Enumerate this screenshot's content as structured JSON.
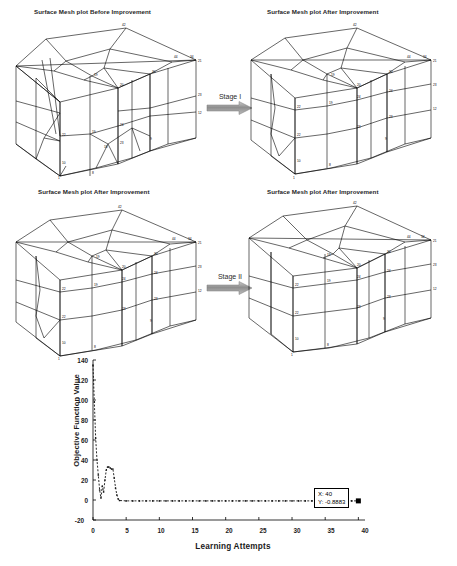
{
  "figure": {
    "panels": [
      {
        "id": "before",
        "title": "Surface Mesh plot Before Improvement"
      },
      {
        "id": "after-stage1",
        "title": "Surface Mesh plot After Improvement"
      },
      {
        "id": "after-stage1-repeat",
        "title": "Surface Mesh plot After Improvement"
      },
      {
        "id": "after-stage2",
        "title": "Surface Mesh plot After Improvement"
      }
    ],
    "arrows": [
      {
        "id": "stage-1",
        "label": "Stage I"
      },
      {
        "id": "stage-2",
        "label": "Stage II"
      }
    ]
  },
  "mesh_node_labels": {
    "before": [
      "42",
      "44",
      "34",
      "21",
      "20",
      "30",
      "19",
      "24",
      "23",
      "12",
      "18",
      "23",
      "22",
      "10",
      "9",
      "8",
      "1"
    ],
    "after": [
      "42",
      "44",
      "34",
      "21",
      "20",
      "30",
      "19",
      "24",
      "23",
      "12",
      "22",
      "10",
      "9",
      "8",
      "1"
    ]
  },
  "chart_data": {
    "type": "line",
    "title": "",
    "xlabel": "Learning Attempts",
    "ylabel": "Objective Function Value",
    "xlim": [
      0,
      41
    ],
    "ylim": [
      -20,
      140
    ],
    "xticks": [
      0,
      5,
      10,
      15,
      20,
      25,
      30,
      35,
      40
    ],
    "yticks": [
      -20,
      0,
      20,
      40,
      60,
      80,
      100,
      120,
      140
    ],
    "grid": false,
    "legend": null,
    "line_style": "dashed",
    "marker": "dot",
    "series": [
      {
        "name": "Objective Function Value",
        "x": [
          0,
          0.2,
          0.4,
          0.6,
          0.8,
          1.0,
          1.2,
          1.4,
          1.6,
          1.8,
          2.0,
          2.2,
          2.4,
          2.6,
          2.8,
          3.0,
          3.2,
          3.4,
          3.6,
          3.8,
          4.0,
          5,
          6,
          7,
          8,
          9,
          10,
          11,
          12,
          13,
          14,
          15,
          16,
          17,
          18,
          19,
          20,
          21,
          22,
          23,
          24,
          25,
          26,
          27,
          28,
          29,
          30,
          31,
          32,
          33,
          34,
          35,
          36,
          37,
          38,
          39,
          40
        ],
        "values": [
          135,
          98,
          62,
          40,
          25,
          10,
          2,
          14,
          8,
          20,
          30,
          33,
          33,
          32,
          31,
          31,
          22,
          12,
          5,
          1,
          -0.5,
          -0.8883,
          -0.8883,
          -0.8883,
          -0.8883,
          -0.8883,
          -0.8883,
          -0.8883,
          -0.8883,
          -0.8883,
          -0.8883,
          -0.8883,
          -0.8883,
          -0.8883,
          -0.8883,
          -0.8883,
          -0.8883,
          -0.8883,
          -0.8883,
          -0.8883,
          -0.8883,
          -0.8883,
          -0.8883,
          -0.8883,
          -0.8883,
          -0.8883,
          -0.8883,
          -0.8883,
          -0.8883,
          -0.8883,
          -0.8883,
          -0.8883,
          -0.8883,
          -0.8883,
          -0.8883,
          -0.8883,
          -0.8883
        ]
      }
    ],
    "annotations": [
      {
        "id": "data-tip",
        "x_label": "X: 40",
        "y_label": "Y: -0.8883",
        "at_x": 40,
        "at_y": -0.8883
      }
    ]
  }
}
